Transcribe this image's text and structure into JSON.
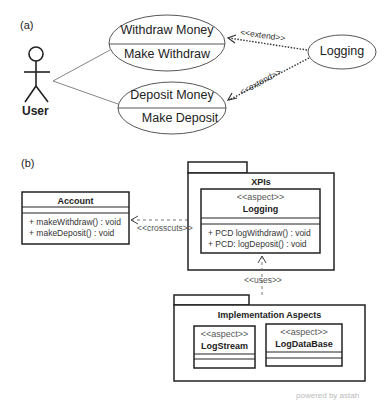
{
  "panel_a": {
    "label": "(a)",
    "actor": {
      "name": "User"
    },
    "use_cases": [
      {
        "top": "Withdraw Money",
        "bottom": "Make Withdraw"
      },
      {
        "top": "Deposit Money",
        "bottom": "Make Deposit"
      }
    ],
    "logging_use_case": "Logging",
    "extend_labels": [
      "<<extend>>",
      "<<extend>>"
    ]
  },
  "panel_b": {
    "label": "(b)",
    "account_class": {
      "name": "Account",
      "operations": [
        "+ makeWithdraw() : void",
        "+ makeDeposit() : void"
      ]
    },
    "crosscuts_label": "<<crosscuts>>",
    "xpis_package": {
      "name": "XPIs",
      "aspect": {
        "stereotype": "<<aspect>>",
        "name": "Logging",
        "operations": [
          "+ PCD logWithdraw() : void",
          "+ PCD: logDeposit() : void"
        ]
      }
    },
    "uses_label": "<<uses>>",
    "impl_package": {
      "name": "Implementation Aspects",
      "aspects": [
        {
          "stereotype": "<<aspect>>",
          "name": "LogStream"
        },
        {
          "stereotype": "<<aspect>>",
          "name": "LogDataBase"
        }
      ]
    }
  },
  "footer": {
    "text": "powered by astah"
  },
  "colors": {
    "line": "#222222",
    "text": "#222222",
    "stereotype": "#555555",
    "footer": "#bbbbbb"
  }
}
